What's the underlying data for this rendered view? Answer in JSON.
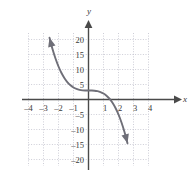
{
  "figure": {
    "background_color": "#ffffff",
    "grid_color": "#b9b9c6",
    "axis_color": "#4a4a4a",
    "curve_color": "#6f6f78",
    "label_color": "#3a3a3a"
  },
  "axis_names": {
    "x": "x",
    "y": "y"
  },
  "chart_data": {
    "type": "line",
    "title": "",
    "xlabel": "x",
    "ylabel": "y",
    "xlim": [
      -4,
      4
    ],
    "ylim": [
      -20,
      20
    ],
    "grid": true,
    "grid_x_step": 1,
    "grid_y_step": 5,
    "legend": "none",
    "xticks": [
      -4,
      -3,
      -2,
      -1,
      1,
      2,
      3,
      4
    ],
    "xtick_labels": [
      "–4",
      "–3",
      "–2",
      "–1",
      "1",
      "2",
      "3",
      "4"
    ],
    "yticks": [
      20,
      15,
      10,
      5,
      -5,
      -10,
      -15,
      -20
    ],
    "ytick_labels": [
      "20",
      "15",
      "10",
      "5",
      "–5",
      "–10",
      "–15",
      "–20"
    ],
    "series": [
      {
        "name": "y = -x^3 + 3",
        "equation": "y = −x³ + 3",
        "arrow_start": true,
        "arrow_end": true,
        "x": [
          -2.6,
          -2.4,
          -2.2,
          -2.0,
          -1.8,
          -1.6,
          -1.4,
          -1.2,
          -1.0,
          -0.8,
          -0.6,
          -0.4,
          -0.2,
          0.0,
          0.2,
          0.4,
          0.6,
          0.8,
          1.0,
          1.2,
          1.4,
          1.6,
          1.8,
          2.0,
          2.2,
          2.4,
          2.6
        ],
        "y": [
          20.58,
          16.82,
          13.65,
          11.0,
          8.83,
          7.1,
          5.74,
          4.73,
          4.0,
          3.51,
          3.22,
          3.06,
          3.01,
          3.0,
          2.99,
          2.94,
          2.78,
          2.49,
          2.0,
          1.27,
          0.26,
          -1.1,
          -2.83,
          -5.0,
          -7.65,
          -10.82,
          -14.58
        ]
      }
    ]
  }
}
